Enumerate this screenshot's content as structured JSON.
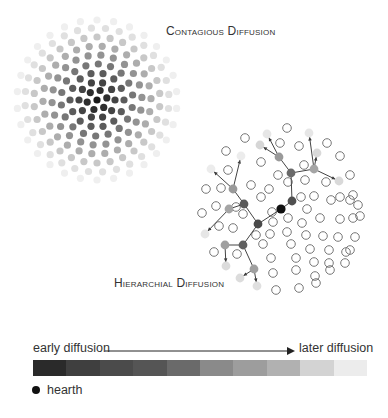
{
  "contagious": {
    "title": "Contagious Diffusion",
    "ring_colors": [
      "#1a1a1a",
      "#2e2e2e",
      "#444444",
      "#5c5c5c",
      "#777777",
      "#939393",
      "#adadad",
      "#c8c8c8",
      "#e0e0e0",
      "#efefef"
    ]
  },
  "hierarchical": {
    "title": "Hierarchial Diffusion",
    "hearth_color": "#111111",
    "open_circle_color": "#777777"
  },
  "legend": {
    "early_label": "early diffusion",
    "later_label": "later diffusion",
    "gradient_colors": [
      "#2a2a2a",
      "#3f3f3f",
      "#4b4b4b",
      "#555555",
      "#6a6a6a",
      "#8a8a8a",
      "#9d9d9d",
      "#b1b1b1",
      "#d3d3d3",
      "#ececec"
    ],
    "hearth_label": "hearth"
  }
}
